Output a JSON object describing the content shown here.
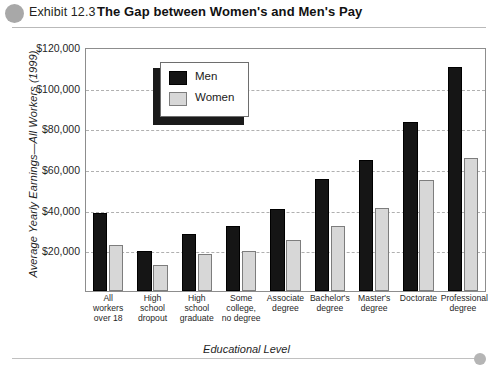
{
  "header": {
    "exhibit_number": "Exhibit 12.3",
    "title": "The Gap between Women's and Men's Pay",
    "dot_color": "#a8a8a8"
  },
  "legend": {
    "men_label": "Men",
    "women_label": "Women"
  },
  "axes": {
    "y_title": "Average Yearly Earnings—All Workers (1999)",
    "x_title": "Educational Level",
    "y_ticks": [
      "$120,000",
      "$100,000",
      "$80,000",
      "$60,000",
      "$40,000",
      "$20,000"
    ]
  },
  "colors": {
    "men_bar": "#151515",
    "women_bar": "#d7d7d7",
    "women_bar_outline": "#7d7d7d",
    "gridline": "#b0b0b0",
    "frame": "#8d8d8d"
  },
  "chart_data": {
    "type": "bar",
    "title": "The Gap between Women's and Men's Pay",
    "xlabel": "Educational Level",
    "ylabel": "Average Yearly Earnings—All Workers (1999)",
    "ylim": [
      0,
      120000
    ],
    "ytick_step": 20000,
    "ytick_values": [
      20000,
      40000,
      60000,
      80000,
      100000,
      120000
    ],
    "grid": true,
    "legend_position": "upper-left-inside",
    "categories": [
      "All workers over 18",
      "High school dropout",
      "High school graduate",
      "Some college, no degree",
      "Associate degree",
      "Bachelor's degree",
      "Master's degree",
      "Doctorate",
      "Professional degree"
    ],
    "category_lines": [
      [
        "All",
        "workers",
        "over 18"
      ],
      [
        "High",
        "school",
        "dropout"
      ],
      [
        "High",
        "school",
        "graduate"
      ],
      [
        "Some",
        "college,",
        "no degree"
      ],
      [
        "Associate",
        "degree"
      ],
      [
        "Bachelor's",
        "degree"
      ],
      [
        "Master's",
        "degree"
      ],
      [
        "Doctorate"
      ],
      [
        "Professional",
        "degree"
      ]
    ],
    "series": [
      {
        "name": "Men",
        "color": "#151515",
        "values": [
          38500,
          20000,
          28500,
          32000,
          40500,
          55500,
          65000,
          84000,
          111000
        ]
      },
      {
        "name": "Women",
        "color": "#d7d7d7",
        "values": [
          23000,
          13000,
          18500,
          20000,
          25500,
          32000,
          41000,
          55000,
          66000
        ]
      }
    ]
  }
}
